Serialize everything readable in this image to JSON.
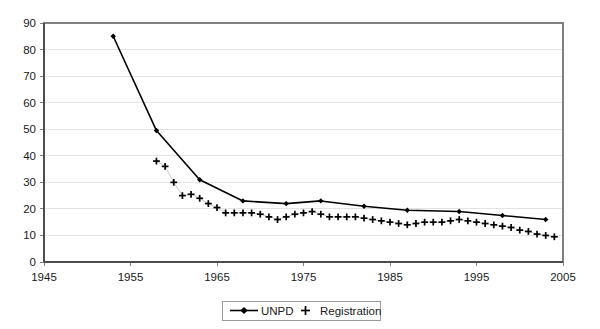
{
  "chart_data": {
    "type": "line",
    "title": "",
    "xlabel": "",
    "ylabel": "",
    "xlim": [
      1945,
      2005
    ],
    "ylim": [
      0,
      90
    ],
    "xticks": [
      1945,
      1955,
      1965,
      1975,
      1985,
      1995,
      2005
    ],
    "yticks": [
      0,
      10,
      20,
      30,
      40,
      50,
      60,
      70,
      80,
      90
    ],
    "grid": "horizontal",
    "legend_position": "bottom-center",
    "series": [
      {
        "name": "UNPD",
        "marker": "diamond",
        "style": "line-with-markers",
        "x": [
          1953,
          1958,
          1963,
          1968,
          1973,
          1977,
          1982,
          1987,
          1993,
          1998,
          2003
        ],
        "values": [
          85,
          49.5,
          31,
          23,
          22,
          23,
          21,
          19.5,
          19,
          17.5,
          16
        ]
      },
      {
        "name": "Registration",
        "marker": "plus",
        "style": "markers-only",
        "x": [
          1958,
          1959,
          1960,
          1961,
          1962,
          1963,
          1964,
          1965,
          1966,
          1967,
          1968,
          1969,
          1970,
          1971,
          1972,
          1973,
          1974,
          1975,
          1976,
          1977,
          1978,
          1979,
          1980,
          1981,
          1982,
          1983,
          1984,
          1985,
          1986,
          1987,
          1988,
          1989,
          1990,
          1991,
          1992,
          1993,
          1994,
          1995,
          1996,
          1997,
          1998,
          1999,
          2000,
          2001,
          2002,
          2003,
          2004
        ],
        "values": [
          38,
          36,
          30,
          25,
          25.5,
          24,
          22,
          20.5,
          18.5,
          18.5,
          18.5,
          18.5,
          18,
          17,
          16,
          17,
          18,
          18.5,
          19,
          18,
          17,
          17,
          17,
          17,
          16.5,
          16,
          15.5,
          15,
          14.5,
          14,
          14.5,
          15,
          15,
          15,
          15.5,
          16,
          15.5,
          15,
          14.5,
          14,
          13.5,
          13,
          12,
          11.5,
          10.5,
          10,
          9.5
        ]
      }
    ]
  },
  "axis": {
    "y_tick_labels": [
      "90",
      "80",
      "70",
      "60",
      "50",
      "40",
      "30",
      "20",
      "10",
      "0"
    ],
    "x_tick_labels": [
      "1945",
      "1955",
      "1965",
      "1975",
      "1985",
      "1995",
      "2005"
    ]
  },
  "legend": {
    "entries": [
      {
        "label": "UNPD",
        "marker": "line-diamond-marker"
      },
      {
        "label": "Registration",
        "marker": "plus-marker"
      }
    ]
  },
  "colors": {
    "series_black": "#000000",
    "gridline": "#e3e3e3",
    "frame": "#808080",
    "background": "#ffffff"
  }
}
